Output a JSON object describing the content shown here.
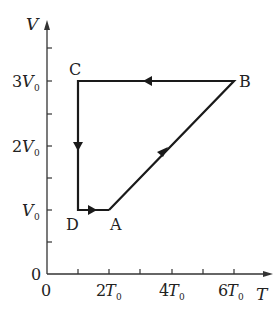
{
  "diagram": {
    "type": "V-T cycle diagram",
    "axes": {
      "y_label": "V",
      "x_label": "T",
      "origin_y": "0",
      "origin_x": "0",
      "y_ticks": [
        {
          "value": 1,
          "label_coef": "",
          "label_var": "V",
          "label_sub": "0"
        },
        {
          "value": 2,
          "label_coef": "2",
          "label_var": "V",
          "label_sub": "0"
        },
        {
          "value": 3,
          "label_coef": "3",
          "label_var": "V",
          "label_sub": "0"
        }
      ],
      "x_ticks": [
        {
          "value": 2,
          "label_coef": "2",
          "label_var": "T",
          "label_sub": "0"
        },
        {
          "value": 4,
          "label_coef": "4",
          "label_var": "T",
          "label_sub": "0"
        },
        {
          "value": 6,
          "label_coef": "6",
          "label_var": "T",
          "label_sub": "0"
        }
      ]
    },
    "points": {
      "A": {
        "label": "A",
        "T": 2,
        "V": 1
      },
      "B": {
        "label": "B",
        "T": 6,
        "V": 3
      },
      "C": {
        "label": "C",
        "T": 1,
        "V": 3
      },
      "D": {
        "label": "D",
        "T": 1,
        "V": 1
      }
    },
    "cycle": [
      "A",
      "B",
      "C",
      "D",
      "A"
    ],
    "line_color": "#1a1a1a"
  }
}
